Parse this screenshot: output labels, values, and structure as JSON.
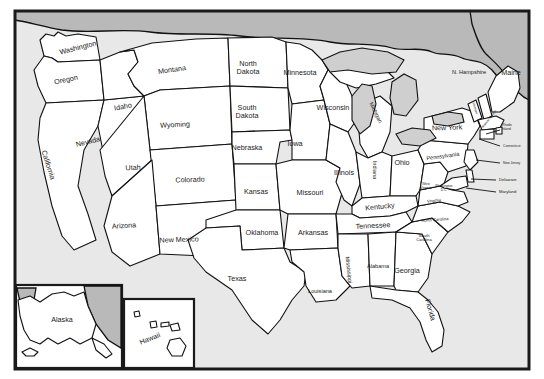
{
  "map": {
    "title": "United States Map with State Names",
    "colors": {
      "land": "#ffffff",
      "border": "#111111",
      "water": "#cfcfcf",
      "canada": "#b9b9b9",
      "ocean": "#e8e8e8",
      "frame": "#1a1a1a",
      "label": "#1a1a1a"
    },
    "frame": {
      "x": 14,
      "y": 10,
      "width": 516,
      "height": 360
    }
  },
  "states": [
    {
      "name": "Washington",
      "label": "Washington",
      "x": 78,
      "y": 48,
      "size": "md",
      "rotate": -14
    },
    {
      "name": "Oregon",
      "label": "Oregon",
      "x": 66,
      "y": 80,
      "size": "md",
      "rotate": -12
    },
    {
      "name": "California",
      "label": "California",
      "x": 48,
      "y": 165,
      "size": "md",
      "rotate": 72
    },
    {
      "name": "Idaho",
      "label": "Idaho",
      "x": 123,
      "y": 107,
      "size": "md",
      "rotate": -10
    },
    {
      "name": "Nevada",
      "label": "Nevada",
      "x": 88,
      "y": 142,
      "size": "md",
      "rotate": -14
    },
    {
      "name": "Montana",
      "label": "Montana",
      "x": 172,
      "y": 70,
      "size": "md",
      "rotate": -8
    },
    {
      "name": "Wyoming",
      "label": "Wyoming",
      "x": 175,
      "y": 125,
      "size": "md",
      "rotate": -3
    },
    {
      "name": "Utah",
      "label": "Utah",
      "x": 133,
      "y": 168,
      "size": "md",
      "rotate": -2
    },
    {
      "name": "Arizona",
      "label": "Arizona",
      "x": 124,
      "y": 226,
      "size": "md",
      "rotate": -4
    },
    {
      "name": "Colorado",
      "label": "Colorado",
      "x": 190,
      "y": 180,
      "size": "md",
      "rotate": -2
    },
    {
      "name": "New Mexico",
      "label": "New Mexico",
      "x": 179,
      "y": 240,
      "size": "md",
      "rotate": -2
    },
    {
      "name": "North Dakota",
      "label": "North Dakota",
      "x": 248,
      "y": 68,
      "size": "md",
      "rotate": 0,
      "lines": [
        "North",
        "Dakota"
      ]
    },
    {
      "name": "South Dakota",
      "label": "South Dakota",
      "x": 247,
      "y": 112,
      "size": "md",
      "rotate": 0,
      "lines": [
        "South",
        "Dakota"
      ]
    },
    {
      "name": "Nebraska",
      "label": "Nebraska",
      "x": 247,
      "y": 148,
      "size": "md",
      "rotate": 0
    },
    {
      "name": "Kansas",
      "label": "Kansas",
      "x": 256,
      "y": 192,
      "size": "md",
      "rotate": 0
    },
    {
      "name": "Oklahoma",
      "label": "Oklahoma",
      "x": 262,
      "y": 233,
      "size": "md",
      "rotate": 0
    },
    {
      "name": "Texas",
      "label": "Texas",
      "x": 237,
      "y": 279,
      "size": "md",
      "rotate": 0
    },
    {
      "name": "Minnesota",
      "label": "Minnesota",
      "x": 300,
      "y": 73,
      "size": "md",
      "rotate": 0
    },
    {
      "name": "Iowa",
      "label": "Iowa",
      "x": 295,
      "y": 144,
      "size": "md",
      "rotate": 0
    },
    {
      "name": "Missouri",
      "label": "Missouri",
      "x": 310,
      "y": 193,
      "size": "md",
      "rotate": 0
    },
    {
      "name": "Arkansas",
      "label": "Arkansas",
      "x": 313,
      "y": 233,
      "size": "md",
      "rotate": 0
    },
    {
      "name": "Louisiana",
      "label": "Louisiana",
      "x": 320,
      "y": 292,
      "size": "sm",
      "rotate": 0
    },
    {
      "name": "Wisconsin",
      "label": "Wisconsin",
      "x": 333,
      "y": 108,
      "size": "md",
      "rotate": 0
    },
    {
      "name": "Illinois",
      "label": "Illinois",
      "x": 344,
      "y": 173,
      "size": "md",
      "rotate": 0
    },
    {
      "name": "Michigan",
      "label": "Michigan",
      "x": 375,
      "y": 113,
      "size": "sm",
      "rotate": 64
    },
    {
      "name": "Indiana",
      "label": "Indiana",
      "x": 374,
      "y": 170,
      "size": "sm",
      "rotate": 90
    },
    {
      "name": "Ohio",
      "label": "Ohio",
      "x": 402,
      "y": 163,
      "size": "md",
      "rotate": 0
    },
    {
      "name": "Kentucky",
      "label": "Kentucky",
      "x": 380,
      "y": 207,
      "size": "md",
      "rotate": -6
    },
    {
      "name": "Tennessee",
      "label": "Tennessee",
      "x": 373,
      "y": 226,
      "size": "md",
      "rotate": -3
    },
    {
      "name": "Mississippi",
      "label": "Mississippi",
      "x": 348,
      "y": 270,
      "size": "sm",
      "rotate": 84
    },
    {
      "name": "Alabama",
      "label": "Alabama",
      "x": 378,
      "y": 267,
      "size": "sm",
      "rotate": 0
    },
    {
      "name": "Georgia",
      "label": "Georgia",
      "x": 407,
      "y": 271,
      "size": "md",
      "rotate": 0
    },
    {
      "name": "Florida",
      "label": "Florida",
      "x": 430,
      "y": 310,
      "size": "md",
      "rotate": 74
    },
    {
      "name": "South Carolina",
      "label": "South Carolina",
      "x": 424,
      "y": 238,
      "size": "xs",
      "rotate": 0,
      "lines": [
        "South",
        "Carolina"
      ]
    },
    {
      "name": "North Carolina",
      "label": "North Carolina",
      "x": 435,
      "y": 220,
      "size": "xs",
      "rotate": -4
    },
    {
      "name": "Virginia",
      "label": "Virginia",
      "x": 434,
      "y": 201,
      "size": "xs",
      "rotate": -6
    },
    {
      "name": "West Virginia",
      "label": "West Virginia",
      "x": 426,
      "y": 186,
      "size": "tiny",
      "rotate": 0,
      "lines": [
        "West",
        "Virginia"
      ]
    },
    {
      "name": "Pennsylvania",
      "label": "Pennsylvania",
      "x": 443,
      "y": 157,
      "size": "sm",
      "rotate": -8
    },
    {
      "name": "New York",
      "label": "New York",
      "x": 447,
      "y": 128,
      "size": "md",
      "rotate": -2
    },
    {
      "name": "Vermont",
      "label": "Vermont",
      "x": 475,
      "y": 108,
      "size": "tiny",
      "rotate": 74
    },
    {
      "name": "Massachusetts",
      "label": "Massachusetts",
      "x": 489,
      "y": 119,
      "size": "tiny",
      "rotate": -52
    },
    {
      "name": "Maine",
      "label": "Maine",
      "x": 511,
      "y": 73,
      "size": "md",
      "rotate": 0
    },
    {
      "name": "New Hampshire",
      "label": "N. Hampshire",
      "x": 469,
      "y": 73,
      "size": "sm",
      "rotate": 0
    },
    {
      "name": "Washington D.C.",
      "label": "Washington D.C.",
      "x": 444,
      "y": 188,
      "size": "tiny",
      "rotate": 0,
      "lines": [
        "Washington",
        "D.C."
      ]
    }
  ],
  "callouts": [
    {
      "name": "Rhode Island",
      "label": "Rhode Island",
      "x": 502,
      "y": 127,
      "size": "tiny",
      "lines": [
        "Rhode",
        "Island"
      ],
      "leader": "M 500 130 L 486 134"
    },
    {
      "name": "Connecticut",
      "label": "Connecticut",
      "x": 503,
      "y": 146,
      "size": "tiny",
      "lines": [
        "Connecticut"
      ],
      "leader": "M 500 146 L 479 139"
    },
    {
      "name": "New Jersey",
      "label": "New Jersey",
      "x": 503,
      "y": 163,
      "size": "tiny",
      "lines": [
        "New Jersey"
      ],
      "leader": "M 500 163 L 476 160"
    },
    {
      "name": "Delaware",
      "label": "Delaware",
      "x": 499,
      "y": 180,
      "size": "xs",
      "lines": [
        "Delaware"
      ],
      "leader": "M 496 180 L 471 179"
    },
    {
      "name": "Maryland",
      "label": "Maryland",
      "x": 499,
      "y": 192,
      "size": "xs",
      "lines": [
        "Maryland"
      ],
      "leader": "M 496 192 L 466 188"
    }
  ],
  "insets": [
    {
      "name": "alaska",
      "label": "Alaska",
      "x": 16,
      "y": 285,
      "width": 106,
      "height": 83,
      "label_x": 62,
      "label_y": 320
    },
    {
      "name": "hawaii",
      "label": "Hawaii",
      "x": 124,
      "y": 299,
      "width": 70,
      "height": 69,
      "label_x": 150,
      "label_y": 339,
      "rotate": -22
    }
  ]
}
